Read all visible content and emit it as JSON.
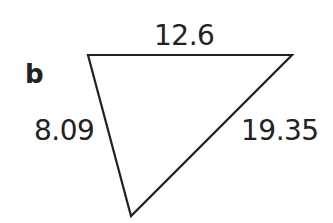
{
  "diagram": {
    "part_label": "b",
    "shape": "triangle",
    "vertices": [
      {
        "x": 88,
        "y": 55
      },
      {
        "x": 292,
        "y": 55
      },
      {
        "x": 131,
        "y": 216
      }
    ],
    "stroke_color": "#222222",
    "side_labels": {
      "top": "12.6",
      "left": "8.09",
      "right": "19.35"
    }
  }
}
